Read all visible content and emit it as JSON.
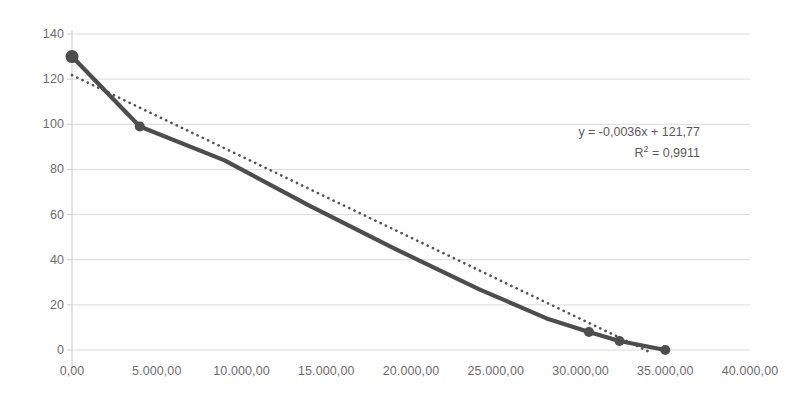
{
  "chart_data": {
    "type": "line",
    "title": "",
    "xlabel": "",
    "ylabel": "",
    "xlim": [
      0,
      40000
    ],
    "ylim": [
      0,
      140
    ],
    "grid": true,
    "legend": false,
    "x_ticks": [
      "0,00",
      "5.000,00",
      "10.000,00",
      "15.000,00",
      "20.000,00",
      "25.000,00",
      "30.000,00",
      "35.000,00",
      "40.000,00"
    ],
    "x_tick_values": [
      0,
      5000,
      10000,
      15000,
      20000,
      25000,
      30000,
      35000,
      40000
    ],
    "y_ticks": [
      "0",
      "20",
      "40",
      "60",
      "80",
      "100",
      "120",
      "140"
    ],
    "y_tick_values": [
      0,
      20,
      40,
      60,
      80,
      100,
      120,
      140
    ],
    "series": [
      {
        "name": "data",
        "style": "solid-line-with-markers",
        "color": "#4d4d4d",
        "x": [
          0,
          4000,
          9000,
          14000,
          19000,
          24000,
          28000,
          30500,
          32300,
          35000
        ],
        "y": [
          130,
          99,
          84,
          64,
          45,
          27,
          14,
          8,
          4,
          0
        ],
        "marker_x": [
          0,
          4000,
          30500,
          32300,
          35000
        ],
        "marker_y": [
          130,
          99,
          8,
          4,
          0
        ]
      },
      {
        "name": "trendline",
        "style": "dotted",
        "color": "#555555",
        "equation": "y = -0,0036x + 121,77",
        "slope": -0.0036,
        "intercept": 121.77,
        "r_squared": 0.9911,
        "x": [
          0,
          34000
        ],
        "y": [
          121.77,
          -0.63
        ]
      }
    ],
    "annotations": {
      "equation_label": "y = -0,0036x + 121,77",
      "r2_prefix": "R",
      "r2_exponent": "2",
      "r2_value": " = 0,9911"
    },
    "colors": {
      "ink": "#4d4d4d",
      "grid": "#dcdcdc",
      "axis": "#d0d0d0",
      "tick_text": "#5a5a5a",
      "background": "#fefefe"
    }
  }
}
